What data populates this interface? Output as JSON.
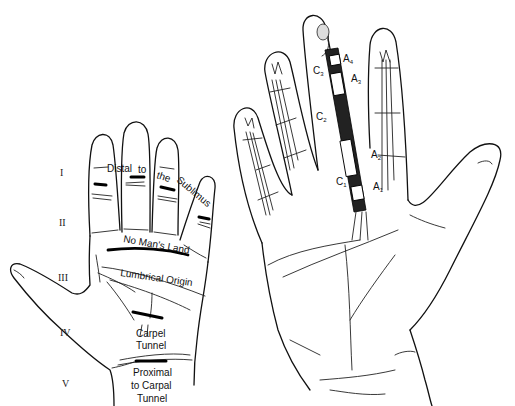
{
  "left_figure": {
    "title": "Flexor tendon zones",
    "zones": [
      {
        "numeral": "I",
        "x": 62,
        "y": 173
      },
      {
        "numeral": "II",
        "x": 60,
        "y": 223
      },
      {
        "numeral": "III",
        "x": 60,
        "y": 279
      },
      {
        "numeral": "IV",
        "x": 62,
        "y": 333
      },
      {
        "numeral": "V",
        "x": 63,
        "y": 385
      }
    ],
    "labels": {
      "distal_1": "Distal",
      "distal_2": "to",
      "distal_3": "the",
      "distal_4": "Sublimus",
      "no_mans_land": "No Man's Land",
      "lumbrical_origin": "Lumbrical Origin",
      "carpel_1": "Carpel",
      "carpel_2": "Tunnel",
      "proximal_1": "Proximal",
      "proximal_2": "to Carpal",
      "proximal_3": "Tunnel"
    }
  },
  "right_figure": {
    "title": "Flexor tendon pulley system",
    "pulleys": {
      "A4": {
        "letter": "A",
        "sub": "4"
      },
      "A3": {
        "letter": "A",
        "sub": "3"
      },
      "A2": {
        "letter": "A",
        "sub": "2"
      },
      "A1": {
        "letter": "A",
        "sub": "1"
      },
      "C3": {
        "letter": "C",
        "sub": "3"
      },
      "C2": {
        "letter": "C",
        "sub": "2"
      },
      "C1": {
        "letter": "C",
        "sub": "1"
      }
    }
  },
  "colors": {
    "line": "#111111",
    "background": "#ffffff"
  }
}
